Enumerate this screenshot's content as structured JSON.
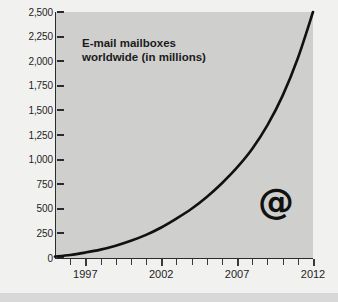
{
  "chart_data": {
    "type": "line",
    "title": "E-mail mailboxes\nworldwide (in millions)",
    "title_line1": "E-mail mailboxes",
    "title_line2": "worldwide (in millions)",
    "xlabel": "",
    "ylabel": "",
    "xlim": [
      1995,
      2012
    ],
    "ylim": [
      0,
      2500
    ],
    "grid": false,
    "legend": false,
    "annotation": "@",
    "line_color": "#111111",
    "plot_background": "#cfcfce",
    "figure_background": "#f1f1f0",
    "y_ticks": [
      0,
      250,
      500,
      750,
      1000,
      1250,
      1500,
      1750,
      2000,
      2250,
      2500
    ],
    "y_tick_labels": [
      "0",
      "250",
      "500",
      "750",
      "1,000",
      "1,250",
      "1,500",
      "1,750",
      "2,000",
      "2,250",
      "2,500"
    ],
    "x_ticks": [
      1996,
      1997,
      1998,
      1999,
      2000,
      2001,
      2002,
      2003,
      2004,
      2005,
      2006,
      2007,
      2008,
      2009,
      2010,
      2011,
      2012
    ],
    "x_tick_labels_major": [
      "1997",
      "2002",
      "2007",
      "2012"
    ],
    "x_major_years": [
      1997,
      2002,
      2007,
      2012
    ],
    "x": [
      1995,
      1996,
      1997,
      1998,
      1999,
      2000,
      2001,
      2002,
      2003,
      2004,
      2005,
      2006,
      2007,
      2008,
      2009,
      2010,
      2011,
      2012
    ],
    "values": [
      15,
      30,
      55,
      85,
      125,
      175,
      235,
      310,
      400,
      500,
      620,
      760,
      920,
      1110,
      1350,
      1650,
      2030,
      2500
    ],
    "series": [
      {
        "name": "E-mail mailboxes worldwide (in millions)",
        "values": [
          15,
          30,
          55,
          85,
          125,
          175,
          235,
          310,
          400,
          500,
          620,
          760,
          920,
          1110,
          1350,
          1650,
          2030,
          2500
        ]
      }
    ]
  }
}
